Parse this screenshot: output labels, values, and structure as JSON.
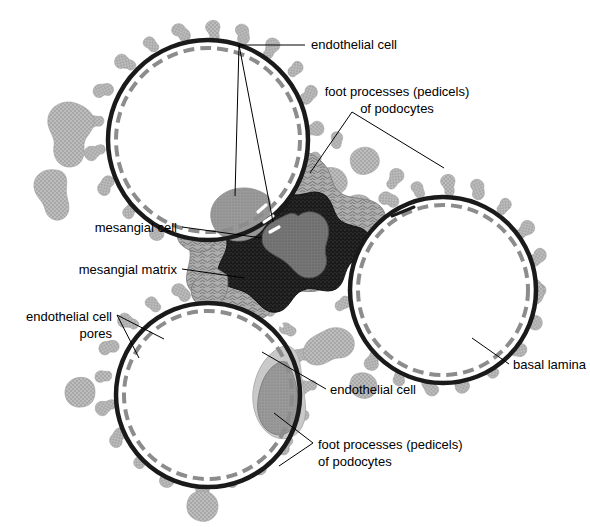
{
  "figure": {
    "background_color": "#ffffff",
    "width": 590,
    "height": 527
  },
  "palette": {
    "background": "#ffffff",
    "capillary_lumen": "#ffffff",
    "basal_lamina": "#1a1a1a",
    "endothelium_dashes": "#8c8c8c",
    "pedicel_gray": "#b5b5b5",
    "pedicel_stipple": "#8f8f8f",
    "mesangial_matrix": "#a8a8a8",
    "mesangial_core_dark": "#1e1e1e",
    "mesangial_cell_nucleus": "#6e6e6e",
    "endothelial_nucleus": "#8a8a8a",
    "leader_line": "#000000",
    "label_text": "#000000"
  },
  "labels": [
    {
      "id": "endothelial-cell-top",
      "text": "endothelial cell",
      "x": 311,
      "y": 49,
      "align": "start"
    },
    {
      "id": "foot-processes-top",
      "line1": "foot processes (pedicels)",
      "line2": "of podocytes",
      "x": 397,
      "y": 96,
      "align": "middle"
    },
    {
      "id": "mesangial-cell",
      "text": "mesangial cell",
      "x": 177,
      "y": 230,
      "align": "end"
    },
    {
      "id": "mesangial-matrix",
      "text": "mesangial matrix",
      "x": 177,
      "y": 272,
      "align": "end"
    },
    {
      "id": "endothelial-cell-pores",
      "line1": "endothelial cell",
      "line2": "pores",
      "x": 112,
      "y": 319,
      "align": "end"
    },
    {
      "id": "basal-lamina",
      "text": "basal lamina",
      "x": 513,
      "y": 367,
      "align": "start"
    },
    {
      "id": "endothelial-cell-bottom",
      "text": "endothelial cell",
      "x": 330,
      "y": 392,
      "align": "start"
    },
    {
      "id": "foot-processes-bottom",
      "line1": "foot processes (pedicels)",
      "line2": "of podocytes",
      "x": 318,
      "y": 447,
      "align": "start"
    }
  ],
  "structures": {
    "capillaries": [
      {
        "id": "capillary-top",
        "center_x": 208,
        "center_y": 140,
        "radius": 100
      },
      {
        "id": "capillary-right",
        "center_x": 443,
        "center_y": 290,
        "radius": 93
      },
      {
        "id": "capillary-bottom",
        "center_x": 208,
        "center_y": 395,
        "radius": 92
      }
    ],
    "mesangium": {
      "center_x": 300,
      "center_y": 258
    },
    "mesangial_cell_nucleus": {
      "center_x": 298,
      "center_y": 258
    },
    "endothelial_nuclei": [
      {
        "id": "endothelial-nucleus-top",
        "center_x": 244,
        "center_y": 190
      },
      {
        "id": "endothelial-nucleus-bottom",
        "center_x": 258,
        "center_y": 398
      }
    ]
  }
}
